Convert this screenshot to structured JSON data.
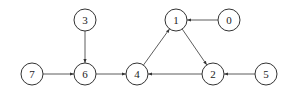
{
  "diagram": {
    "type": "directed-graph",
    "style": {
      "stroke": "#333333",
      "fill": "#ffffff",
      "node_radius": 11
    },
    "nodes": [
      {
        "id": "0",
        "label": "0",
        "x": 229,
        "y": 20
      },
      {
        "id": "1",
        "label": "1",
        "x": 176,
        "y": 20
      },
      {
        "id": "2",
        "label": "2",
        "x": 213,
        "y": 74
      },
      {
        "id": "3",
        "label": "3",
        "x": 85,
        "y": 20
      },
      {
        "id": "4",
        "label": "4",
        "x": 137,
        "y": 74
      },
      {
        "id": "5",
        "label": "5",
        "x": 266,
        "y": 74
      },
      {
        "id": "6",
        "label": "6",
        "x": 85,
        "y": 74
      },
      {
        "id": "7",
        "label": "7",
        "x": 32,
        "y": 74
      }
    ],
    "edges": [
      {
        "from": "3",
        "to": "6"
      },
      {
        "from": "7",
        "to": "6"
      },
      {
        "from": "6",
        "to": "4"
      },
      {
        "from": "4",
        "to": "1"
      },
      {
        "from": "1",
        "to": "2"
      },
      {
        "from": "0",
        "to": "1"
      },
      {
        "from": "2",
        "to": "4"
      },
      {
        "from": "5",
        "to": "2"
      }
    ]
  }
}
